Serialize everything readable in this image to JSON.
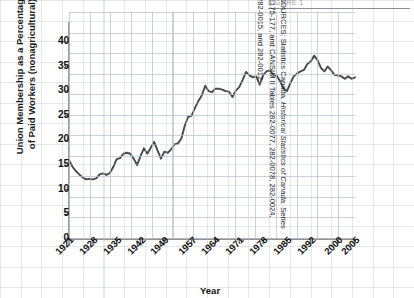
{
  "figure": {
    "top_clipped_text": "FIGURE 1",
    "ylabel_line1": "Union Membership as a Percentage",
    "ylabel_line2": "of Paid Workers (nonagricultural)",
    "xlabel": "Year",
    "line_color": "#4a4a4a",
    "grid_color": "#bac1cd",
    "axis_color": "#6e6e6e",
    "text_color": "#111111"
  },
  "sources": {
    "line1_prefix": "SOURCES: Statistics Canada. ",
    "line1_italic": "Historical Statistics of Canada.",
    "line1_suffix": " Series",
    "line2": "E175-177, and CANSIM II Tables 282-0077, 282-0078, 282-0024,",
    "line3": "282-0015, and 282-0012."
  },
  "chart_data": {
    "type": "line",
    "title": "",
    "xlabel": "Year",
    "ylabel": "Union Membership as a Percentage of Paid Workers (nonagricultural)",
    "xlim": [
      1921,
      2005
    ],
    "ylim": [
      0,
      42
    ],
    "ytick_values": [
      0,
      5,
      10,
      15,
      20,
      25,
      30,
      35,
      40
    ],
    "xtick_labels": [
      "1921",
      "1928",
      "1935",
      "1942",
      "1949",
      "1957",
      "1964",
      "1971",
      "1978",
      "1985",
      "1992",
      "2000",
      "2005"
    ],
    "xtick_values": [
      1921,
      1928,
      1935,
      1942,
      1949,
      1957,
      1964,
      1971,
      1978,
      1985,
      1992,
      2000,
      2005
    ],
    "grid": true,
    "legend": "none",
    "series": [
      {
        "name": "Union membership (% of nonagricultural paid workers)",
        "x": [
          1921,
          1922,
          1923,
          1924,
          1925,
          1926,
          1927,
          1928,
          1929,
          1930,
          1931,
          1932,
          1933,
          1934,
          1935,
          1936,
          1937,
          1938,
          1939,
          1940,
          1941,
          1942,
          1943,
          1944,
          1945,
          1946,
          1947,
          1948,
          1949,
          1950,
          1951,
          1952,
          1953,
          1954,
          1955,
          1956,
          1957,
          1958,
          1959,
          1960,
          1961,
          1962,
          1963,
          1964,
          1965,
          1966,
          1967,
          1968,
          1969,
          1970,
          1971,
          1972,
          1973,
          1974,
          1975,
          1976,
          1977,
          1978,
          1979,
          1980,
          1981,
          1982,
          1983,
          1984,
          1985,
          1986,
          1987,
          1988,
          1989,
          1990,
          1991,
          1992,
          1993,
          1994,
          1995,
          1996,
          1997,
          1998,
          1999,
          2000,
          2001,
          2002,
          2003,
          2004,
          2005
        ],
        "y": [
          16.0,
          14.7,
          13.8,
          13.1,
          12.5,
          12.1,
          12.2,
          12.1,
          12.3,
          13.1,
          13.3,
          13.0,
          13.4,
          14.6,
          16.2,
          16.4,
          17.3,
          17.5,
          17.3,
          16.3,
          15.0,
          16.8,
          18.4,
          17.3,
          18.5,
          19.7,
          18.0,
          16.3,
          17.7,
          17.5,
          18.2,
          19.2,
          19.4,
          20.4,
          23.0,
          24.8,
          25.0,
          26.6,
          28.0,
          29.1,
          31.1,
          30.0,
          29.8,
          30.5,
          30.5,
          30.3,
          30.0,
          29.9,
          28.8,
          30.1,
          30.8,
          32.3,
          33.9,
          33.2,
          32.8,
          33.0,
          31.3,
          33.2,
          34.0,
          34.2,
          33.3,
          33.1,
          32.0,
          30.6,
          30.0,
          31.6,
          33.0,
          33.6,
          34.0,
          34.3,
          35.5,
          36.0,
          37.2,
          36.3,
          34.7,
          34.0,
          35.0,
          34.2,
          33.3,
          33.2,
          33.0,
          32.5,
          33.0,
          32.5,
          32.8
        ],
        "color": "#4a4a4a"
      }
    ]
  }
}
